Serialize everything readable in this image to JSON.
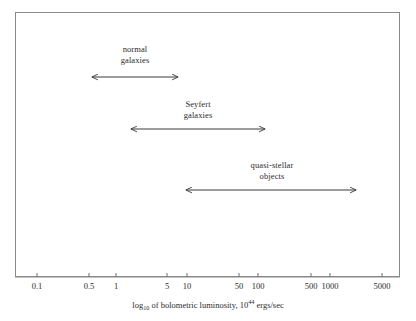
{
  "figure": {
    "background_color": "#ffffff",
    "frame_color": "#8a8a8a",
    "ink_color": "#2b2b2b",
    "caption": {
      "prefix": "log",
      "subscript": "10",
      "middle": " of bolometric luminosity, 10",
      "superscript": "44",
      "suffix": " ergs/sec"
    }
  },
  "chart_data": {
    "type": "bar",
    "title": "",
    "xlabel": "log10 of bolometric luminosity, 10^44 ergs/sec",
    "ylabel": "",
    "x_scale": "log",
    "xlim": [
      0.07,
      9000
    ],
    "grid": false,
    "legend": "none",
    "tick_labels": [
      "0.1",
      "0.5",
      "1",
      "5",
      "10",
      "50",
      "100",
      "500",
      "1000",
      "5000"
    ],
    "tick_values": [
      0.1,
      0.5,
      1,
      5,
      10,
      50,
      100,
      500,
      1000,
      5000
    ],
    "tick_x_px": [
      37,
      89,
      116,
      167,
      187,
      239,
      258,
      311,
      330,
      382
    ],
    "categories": [
      "normal galaxies",
      "Seyfert galaxies",
      "quasi-stellar objects"
    ],
    "ranges": [
      {
        "name": "normal galaxies",
        "label_lines": [
          "normal",
          "galaxies"
        ],
        "low": 0.3,
        "high": 17,
        "x_start_px": 92,
        "x_end_px": 178,
        "y_px": 77,
        "label_x_px": 135,
        "label_top_px": 44
      },
      {
        "name": "Seyfert galaxies",
        "label_lines": [
          "Seyfert",
          "galaxies"
        ],
        "low": 1.8,
        "high": 180,
        "x_start_px": 131,
        "x_end_px": 265,
        "y_px": 129,
        "label_x_px": 198,
        "label_top_px": 99
      },
      {
        "name": "quasi-stellar objects",
        "label_lines": [
          "quasi-stellar",
          "objects"
        ],
        "low": 9,
        "high": 2600,
        "x_start_px": 186,
        "x_end_px": 356,
        "y_px": 190,
        "label_x_px": 272,
        "label_top_px": 160
      }
    ]
  }
}
